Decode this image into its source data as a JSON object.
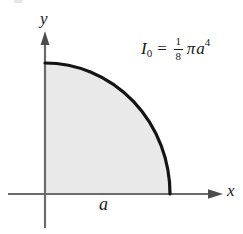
{
  "figure": {
    "background_color": "#ffffff",
    "axes": {
      "x_label": "x",
      "y_label": "y",
      "axis_color": "#6b6b6b",
      "origin": {
        "x": 45,
        "y": 194
      }
    },
    "shape": {
      "kind": "quarter-circle",
      "radius_label": "a",
      "fill_color": "#e9e9e9",
      "outline_color": "#141414",
      "outline_width": 3,
      "radius_x": 125,
      "radius_y": 131
    },
    "formula": {
      "symbol": "I",
      "subscript": "0",
      "equals": "=",
      "fraction_numerator": "1",
      "fraction_denominator": "8",
      "pi": "π",
      "variable": "a",
      "exponent": "4",
      "plain_text": "I0 = 1/8 π a^4"
    }
  }
}
